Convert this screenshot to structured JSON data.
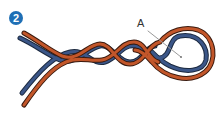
{
  "figure": {
    "step_number": "2",
    "callout_label": "A",
    "colors": {
      "badge": "#1f6fb5",
      "rope_red": "#b84a1f",
      "rope_blue": "#2e4a7a",
      "rope_outline": "#2a2a2a",
      "leader_line": "#9a9a9a"
    }
  }
}
